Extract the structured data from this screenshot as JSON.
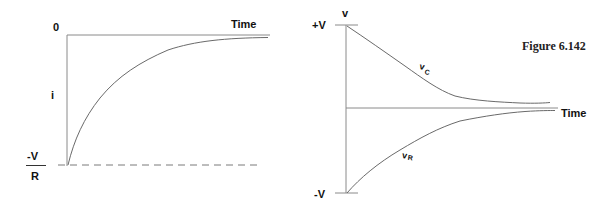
{
  "figure": {
    "caption": "Figure 6.142"
  },
  "left_plot": {
    "y_axis_label": "i",
    "top_tick_label": "0",
    "bottom_tick_numerator": "-V",
    "bottom_tick_denominator": "R",
    "x_axis_label": "Time"
  },
  "right_plot": {
    "y_axis_label": "v",
    "top_tick_label": "+V",
    "bottom_tick_label": "-V",
    "x_axis_label": "Time",
    "curve_labels": {
      "vc": "v",
      "vc_sub": "C",
      "vr": "v",
      "vr_sub": "R"
    }
  }
}
